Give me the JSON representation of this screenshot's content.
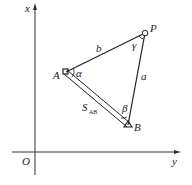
{
  "diagram": {
    "axes": {
      "vertical_label": "x",
      "horizontal_label": "y",
      "origin_label": "O"
    },
    "points": {
      "A": "A",
      "B": "B",
      "P": "P"
    },
    "sides": {
      "b": "b",
      "a": "a",
      "s_main": "S",
      "s_sub": "AB"
    },
    "angles": {
      "alpha": "α",
      "beta": "β",
      "gamma": "γ"
    }
  }
}
